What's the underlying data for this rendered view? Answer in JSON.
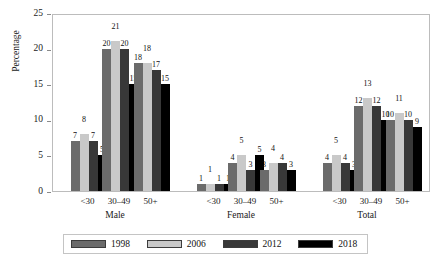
{
  "chart_data": {
    "type": "bar",
    "title": "",
    "xlabel": "",
    "ylabel": "Percentage",
    "ylim": [
      0,
      25
    ],
    "yticks": [
      0,
      5,
      10,
      15,
      20,
      25
    ],
    "grid": false,
    "legend_position": "bottom",
    "categories": [
      "Male <30",
      "Male 30–49",
      "Male 50+",
      "Female <30",
      "Female 30–49",
      "Female 50+",
      "Total <30",
      "Total 30–49",
      "Total 50+"
    ],
    "group_labels": [
      "Male",
      "Female",
      "Total"
    ],
    "age_labels": [
      "<30",
      "30–49",
      "50+"
    ],
    "series": [
      {
        "name": "1998",
        "color": "#6b6b6b",
        "values": [
          7,
          20,
          18,
          1,
          4,
          3,
          4,
          12,
          10
        ]
      },
      {
        "name": "2006",
        "color": "#c9c9c9",
        "values": [
          8,
          21,
          18,
          1,
          5,
          4,
          5,
          13,
          11
        ]
      },
      {
        "name": "2012",
        "color": "#383838",
        "values": [
          7,
          20,
          17,
          1,
          3,
          4,
          4,
          12,
          10
        ]
      },
      {
        "name": "2018",
        "color": "#000000",
        "values": [
          5,
          15,
          15,
          1,
          5,
          3,
          3,
          10,
          9
        ]
      }
    ]
  },
  "legend": {
    "entries": [
      {
        "label": "1998"
      },
      {
        "label": "2006"
      },
      {
        "label": "2012"
      },
      {
        "label": "2018"
      }
    ]
  }
}
